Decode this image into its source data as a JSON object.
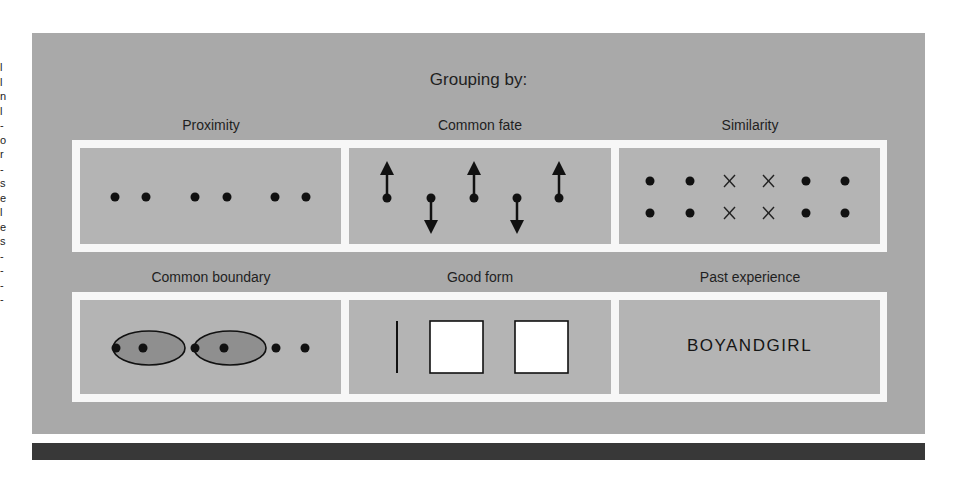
{
  "figure": {
    "title": "Grouping by:",
    "colors": {
      "panel": "#a9a9a9",
      "cell": "#b4b4b4",
      "frame": "#f7f7f7",
      "ink": "#111111",
      "ellipse_fill": "#8f8f8f",
      "bottom_bar": "#383838"
    },
    "rows": [
      {
        "cells": [
          {
            "label": "Proximity",
            "content": "six dots in three pairs"
          },
          {
            "label": "Common fate",
            "content": "dots with arrows: up, down, up, down, up"
          },
          {
            "label": "Similarity",
            "content": "two rows: dot dot X X dot dot"
          }
        ]
      },
      {
        "cells": [
          {
            "label": "Common boundary",
            "content": "dot, two ellipses each enclosing two dots, dot"
          },
          {
            "label": "Good form",
            "content": "vertical line, two squares"
          },
          {
            "label": "Past experience",
            "content": "BOYANDGIRL"
          }
        ]
      }
    ],
    "similarity_glyphs": [
      "●",
      "●",
      "×",
      "×",
      "●",
      "●"
    ],
    "past_experience_word": "BOYANDGIRL"
  },
  "edge_text": [
    "l",
    "l",
    "n",
    "l",
    "-",
    "o",
    "r",
    "-",
    "s",
    "e",
    "l",
    "e",
    "s",
    "-",
    "-",
    "-",
    "-"
  ]
}
